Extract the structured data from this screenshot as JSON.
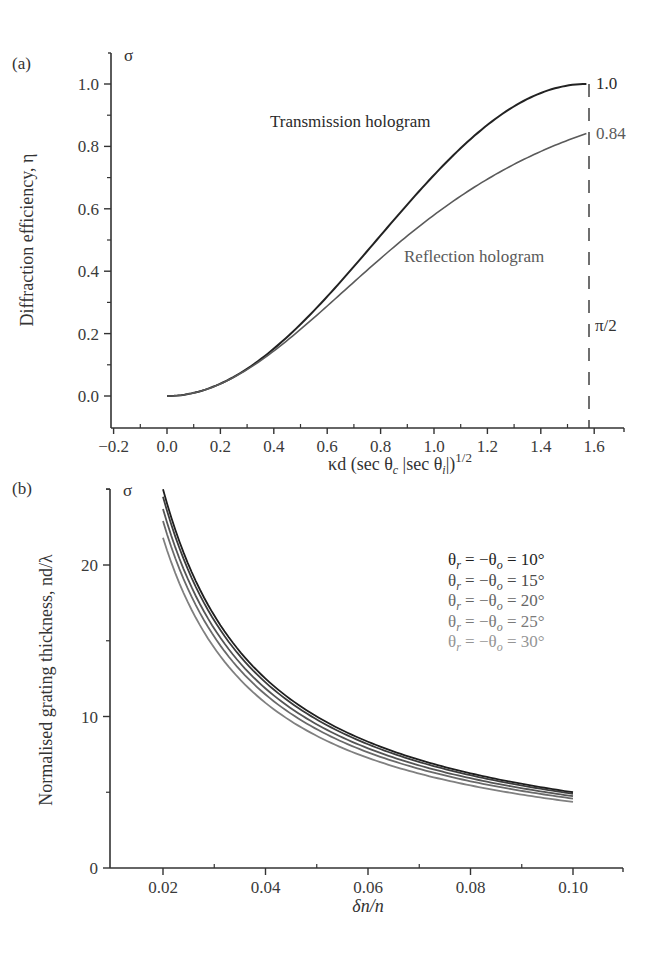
{
  "chart_data": [
    {
      "panel": "(a)",
      "type": "line",
      "title": "",
      "corner_symbol": "σ",
      "xlabel": "κd (sec θc |sec θi|)^1/2",
      "ylabel": "Diffraction efficiency, η",
      "xlim": [
        -0.2,
        1.7
      ],
      "ylim": [
        -0.1,
        1.1
      ],
      "xticks": [
        "-0.2",
        "0.0",
        "0.2",
        "0.4",
        "0.6",
        "0.8",
        "1.0",
        "1.2",
        "1.4",
        "1.6"
      ],
      "yticks": [
        "0.0",
        "0.2",
        "0.4",
        "0.6",
        "0.8",
        "1.0"
      ],
      "grid": false,
      "series": [
        {
          "name": "Transmission hologram",
          "formula": "sin^2(x)",
          "x": [
            0.0,
            0.2,
            0.4,
            0.6,
            0.8,
            1.0,
            1.2,
            1.4,
            1.5708
          ],
          "values": [
            0.0,
            0.039,
            0.152,
            0.319,
            0.515,
            0.708,
            0.869,
            0.971,
            1.0
          ],
          "color": "#222222"
        },
        {
          "name": "Reflection hologram",
          "formula": "tanh^2(x)",
          "x": [
            0.0,
            0.2,
            0.4,
            0.6,
            0.8,
            1.0,
            1.2,
            1.4,
            1.5708
          ],
          "values": [
            0.0,
            0.039,
            0.144,
            0.288,
            0.441,
            0.58,
            0.696,
            0.785,
            0.84
          ],
          "color": "#5a5a5a"
        }
      ],
      "annotations": [
        {
          "text": "Transmission hologram"
        },
        {
          "text": "Reflection hologram"
        },
        {
          "text": "1.0"
        },
        {
          "text": "0.84"
        },
        {
          "text": "π/2",
          "note": "dashed vertical line at x = π/2"
        }
      ]
    },
    {
      "panel": "(b)",
      "type": "line",
      "title": "",
      "corner_symbol": "σ",
      "xlabel": "δn/n",
      "ylabel": "Normalised grating thickness, nd/λ",
      "xlim": [
        0.01,
        0.11
      ],
      "ylim": [
        0,
        25
      ],
      "xticks": [
        "0.02",
        "0.04",
        "0.06",
        "0.08",
        "0.10"
      ],
      "yticks": [
        "0",
        "10",
        "20"
      ],
      "grid": false,
      "legend_position": "upper right (inline labels)",
      "series": [
        {
          "name": "θr = −θo = 10°",
          "x": [
            0.02,
            0.04,
            0.06,
            0.08,
            0.1
          ],
          "values": [
            25.0,
            12.5,
            8.3,
            6.25,
            5.0
          ],
          "color": "#1e1e1e"
        },
        {
          "name": "θr = −θo = 15°",
          "x": [
            0.02,
            0.04,
            0.06,
            0.08,
            0.1
          ],
          "values": [
            24.5,
            12.2,
            8.15,
            6.1,
            4.9
          ],
          "color": "#3c3c3c"
        },
        {
          "name": "θr = −θo = 20°",
          "x": [
            0.02,
            0.04,
            0.06,
            0.08,
            0.1
          ],
          "values": [
            23.7,
            11.85,
            7.9,
            5.93,
            4.74
          ],
          "color": "#555555"
        },
        {
          "name": "θr = −θo = 25°",
          "x": [
            0.02,
            0.04,
            0.06,
            0.08,
            0.1
          ],
          "values": [
            22.9,
            11.45,
            7.63,
            5.72,
            4.58
          ],
          "color": "#6a6a6a"
        },
        {
          "name": "θr = −θo = 30°",
          "x": [
            0.02,
            0.04,
            0.06,
            0.08,
            0.1
          ],
          "values": [
            21.8,
            10.9,
            7.27,
            5.45,
            4.36
          ],
          "color": "#808080"
        }
      ]
    }
  ],
  "labels": {
    "panel_a": "(a)",
    "panel_b": "(b)",
    "sigma": "σ",
    "a_xlabel_main": "κd (sec θ",
    "a_xlabel_c": "c",
    "a_xlabel_mid": " |sec θ",
    "a_xlabel_i": "i",
    "a_xlabel_end": "|)",
    "a_xlabel_exp": "1/2",
    "a_ylabel": "Diffraction efficiency, η",
    "a_transmission": "Transmission hologram",
    "a_reflection": "Reflection hologram",
    "a_end_transmission": "1.0",
    "a_end_reflection": "0.84",
    "a_pi_half": "π/2",
    "a_xticks": [
      "−0.2",
      "0.0",
      "0.2",
      "0.4",
      "0.6",
      "0.8",
      "1.0",
      "1.2",
      "1.4",
      "1.6"
    ],
    "a_yticks": [
      "0.0",
      "0.2",
      "0.4",
      "0.6",
      "0.8",
      "1.0"
    ],
    "b_xlabel": "δn/n",
    "b_ylabel": "Normalised grating thickness, nd/λ",
    "b_xticks": [
      "0.02",
      "0.04",
      "0.06",
      "0.08",
      "0.10"
    ],
    "b_yticks": [
      "0",
      "10",
      "20"
    ],
    "b_legend": [
      {
        "theta": "θ",
        "r": "r",
        "mid": " = −θ",
        "o": "o",
        "val": " = 10°",
        "color": "#1e1e1e"
      },
      {
        "theta": "θ",
        "r": "r",
        "mid": " = −θ",
        "o": "o",
        "val": " = 15°",
        "color": "#4a4a4a"
      },
      {
        "theta": "θ",
        "r": "r",
        "mid": " = −θ",
        "o": "o",
        "val": " = 20°",
        "color": "#666666"
      },
      {
        "theta": "θ",
        "r": "r",
        "mid": " = −θ",
        "o": "o",
        "val": " = 25°",
        "color": "#7a7a7a"
      },
      {
        "theta": "θ",
        "r": "r",
        "mid": " = −θ",
        "o": "o",
        "val": " = 30°",
        "color": "#959595"
      }
    ]
  }
}
